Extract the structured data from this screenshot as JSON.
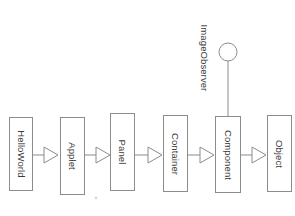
{
  "diagram": {
    "type": "uml-class-hierarchy",
    "title": "",
    "notation": "UML generalization (hollow triangle) with lollipop interface",
    "background_color": "#ffffff",
    "line_color": "#8c8c8c",
    "box_fill_color": "#ffffff",
    "text_color": "#3a3a3a",
    "classes": [
      {
        "id": "helloworld",
        "label": "HelloWorld",
        "x": 9,
        "y": 117,
        "w": 24,
        "h": 74
      },
      {
        "id": "applet",
        "label": "Applet",
        "x": 60,
        "y": 117,
        "w": 25,
        "h": 78
      },
      {
        "id": "panel",
        "label": "Panel",
        "x": 110,
        "y": 113,
        "w": 25,
        "h": 78
      },
      {
        "id": "container",
        "label": "Container",
        "x": 163,
        "y": 115,
        "w": 25,
        "h": 77
      },
      {
        "id": "component",
        "label": "Component",
        "x": 215,
        "y": 116,
        "w": 26,
        "h": 77
      },
      {
        "id": "object",
        "label": "Object",
        "x": 267,
        "y": 115,
        "w": 25,
        "h": 77
      }
    ],
    "interfaces": [
      {
        "id": "imageobserver",
        "label": "ImageObserver",
        "cx": 228,
        "cy": 52,
        "r": 9,
        "attached_to": "component"
      }
    ],
    "generalizations": [
      {
        "from": "helloworld",
        "to": "applet"
      },
      {
        "from": "applet",
        "to": "panel"
      },
      {
        "from": "panel",
        "to": "container"
      },
      {
        "from": "container",
        "to": "component"
      },
      {
        "from": "component",
        "to": "object"
      }
    ]
  }
}
